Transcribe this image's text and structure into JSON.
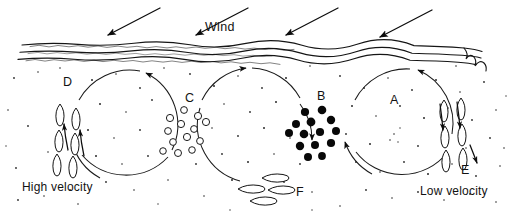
{
  "figure": {
    "type": "wind-erosion-convection-diagram",
    "width": 511,
    "height": 219,
    "background_color": "#ffffff",
    "ink_color": "#121212"
  },
  "labels": {
    "wind": "Wind",
    "high_velocity": "High velocity",
    "low_velocity": "Low velocity",
    "cell_a": "A",
    "cell_b": "B",
    "cell_c": "C",
    "cell_d": "D",
    "cell_e": "E",
    "cell_f": "F"
  },
  "wind_arrows": [
    {
      "name": "wind-arrow-1",
      "x1": 160,
      "y1": 8,
      "x2": 104,
      "y2": 37
    },
    {
      "name": "wind-arrow-2",
      "x1": 248,
      "y1": 8,
      "x2": 192,
      "y2": 37
    },
    {
      "name": "wind-arrow-3",
      "x1": 338,
      "y1": 8,
      "x2": 282,
      "y2": 37
    },
    {
      "name": "wind-arrow-4",
      "x1": 432,
      "y1": 10,
      "x2": 376,
      "y2": 39
    }
  ],
  "crust_lines": [
    {
      "name": "crust-line-top",
      "y": 44
    },
    {
      "name": "crust-line-middle",
      "y": 51
    },
    {
      "name": "crust-line-bottom",
      "y": 58
    }
  ],
  "circulation_cells": [
    {
      "name": "circulation-cell-left",
      "cx": 120,
      "cy": 126,
      "r": 58,
      "direction": "clockwise"
    },
    {
      "name": "circulation-cell-middle",
      "cx": 258,
      "cy": 126,
      "r": 58,
      "direction": "counter-clockwise"
    },
    {
      "name": "circulation-cell-a",
      "cx": 396,
      "cy": 126,
      "r": 58,
      "direction": "clockwise"
    }
  ],
  "particle_zones": [
    {
      "name": "zone-d-rising-grains",
      "letter": "D",
      "letter_x": 63,
      "letter_y": 86,
      "style": "elongated-leaf-vertical",
      "description": "rising elongated grains at high velocity zone"
    },
    {
      "name": "zone-c-open-grains",
      "letter": "C",
      "letter_x": 188,
      "letter_y": 102,
      "style": "open-circle",
      "description": "cluster of hollow circular grains"
    },
    {
      "name": "zone-b-solid-grains",
      "letter": "B",
      "letter_x": 320,
      "letter_y": 100,
      "style": "solid-circle",
      "description": "cluster of filled circular grains"
    },
    {
      "name": "zone-e-settling-grains",
      "letter": "E",
      "letter_x": 464,
      "letter_y": 172,
      "style": "elongated-leaf-vertical",
      "description": "descending elongated grains at low velocity zone"
    },
    {
      "name": "zone-f-horizontal-grains",
      "letter": "F",
      "letter_x": 297,
      "letter_y": 196,
      "style": "elongated-leaf-horizontal",
      "description": "horizontally drifting elongated grains along floor"
    },
    {
      "name": "zone-a-cell-interior",
      "letter": "A",
      "letter_x": 392,
      "letter_y": 104,
      "style": "none",
      "description": "interior of right circulation cell"
    }
  ],
  "open_grains": [
    {
      "cx": 170,
      "cy": 118,
      "r": 3.6
    },
    {
      "cx": 184,
      "cy": 110,
      "r": 3.4
    },
    {
      "cx": 198,
      "cy": 116,
      "r": 3.6
    },
    {
      "cx": 168,
      "cy": 131,
      "r": 3.4
    },
    {
      "cx": 181,
      "cy": 124,
      "r": 3.6
    },
    {
      "cx": 194,
      "cy": 129,
      "r": 3.4
    },
    {
      "cx": 206,
      "cy": 122,
      "r": 3.6
    },
    {
      "cx": 173,
      "cy": 142,
      "r": 3.4
    },
    {
      "cx": 187,
      "cy": 137,
      "r": 3.6
    },
    {
      "cx": 200,
      "cy": 141,
      "r": 3.4
    },
    {
      "cx": 163,
      "cy": 151,
      "r": 3.3
    },
    {
      "cx": 178,
      "cy": 153,
      "r": 3.5
    },
    {
      "cx": 192,
      "cy": 150,
      "r": 3.3
    }
  ],
  "solid_grains": [
    {
      "cx": 305,
      "cy": 112,
      "r": 4.1
    },
    {
      "cx": 322,
      "cy": 110,
      "r": 4.3
    },
    {
      "cx": 296,
      "cy": 124,
      "r": 4.0
    },
    {
      "cx": 311,
      "cy": 122,
      "r": 4.4
    },
    {
      "cx": 331,
      "cy": 120,
      "r": 4.2
    },
    {
      "cx": 289,
      "cy": 133,
      "r": 4.0
    },
    {
      "cx": 304,
      "cy": 134,
      "r": 4.3
    },
    {
      "cx": 320,
      "cy": 132,
      "r": 4.1
    },
    {
      "cx": 336,
      "cy": 131,
      "r": 4.0
    },
    {
      "cx": 300,
      "cy": 146,
      "r": 4.2
    },
    {
      "cx": 315,
      "cy": 145,
      "r": 4.0
    },
    {
      "cx": 331,
      "cy": 143,
      "r": 4.1
    },
    {
      "cx": 308,
      "cy": 157,
      "r": 4.0
    },
    {
      "cx": 322,
      "cy": 156,
      "r": 3.9
    }
  ],
  "grain_dots_count": 96
}
